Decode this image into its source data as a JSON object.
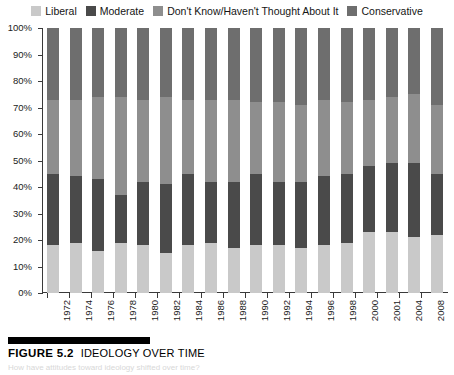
{
  "legend": {
    "items": [
      {
        "label": "Liberal",
        "color": "#c9c9c9",
        "name": "legend-liberal"
      },
      {
        "label": "Moderate",
        "color": "#4a4a4a",
        "name": "legend-moderate"
      },
      {
        "label": "Don't Know/Haven't Thought About It",
        "color": "#8e8e8e",
        "name": "legend-dont-know"
      },
      {
        "label": "Conservative",
        "color": "#6e6e6e",
        "name": "legend-conservative"
      }
    ]
  },
  "caption": {
    "figure_number": "FIGURE 5.2",
    "title": "IDEOLOGY OVER TIME",
    "subtitle": "How have attitudes toward ideology shifted over time?"
  },
  "chart_data": {
    "type": "bar",
    "title": "Ideology Over Time",
    "subtype": "stacked-100-percent",
    "xlabel": "",
    "ylabel": "",
    "ylim": [
      0,
      100
    ],
    "ytick_labels": [
      "0%",
      "10%",
      "20%",
      "30%",
      "40%",
      "50%",
      "60%",
      "70%",
      "80%",
      "90%",
      "100%"
    ],
    "ytick_values": [
      0,
      10,
      20,
      30,
      40,
      50,
      60,
      70,
      80,
      90,
      100
    ],
    "grid": false,
    "legend_position": "top",
    "categories": [
      "1972",
      "1974",
      "1976",
      "1978",
      "1980",
      "1982",
      "1984",
      "1986",
      "1988",
      "1990",
      "1992",
      "1994",
      "1996",
      "1998",
      "2000",
      "2001",
      "2004",
      "2008"
    ],
    "series": [
      {
        "name": "Liberal",
        "color": "#c9c9c9",
        "values": [
          18,
          19,
          16,
          19,
          18,
          15,
          18,
          19,
          17,
          18,
          18,
          17,
          18,
          19,
          23,
          23,
          21,
          22
        ]
      },
      {
        "name": "Moderate",
        "color": "#4a4a4a",
        "values": [
          27,
          25,
          27,
          18,
          24,
          26,
          27,
          23,
          25,
          27,
          24,
          25,
          26,
          26,
          25,
          26,
          28,
          23
        ]
      },
      {
        "name": "Don't Know/Haven't Thought About It",
        "color": "#8e8e8e",
        "values": [
          28,
          29,
          31,
          37,
          31,
          33,
          28,
          31,
          31,
          27,
          30,
          29,
          29,
          27,
          25,
          25,
          26,
          26
        ]
      },
      {
        "name": "Conservative",
        "color": "#6e6e6e",
        "values": [
          27,
          27,
          26,
          26,
          27,
          26,
          27,
          27,
          27,
          28,
          28,
          29,
          27,
          28,
          27,
          26,
          25,
          29
        ]
      }
    ]
  }
}
